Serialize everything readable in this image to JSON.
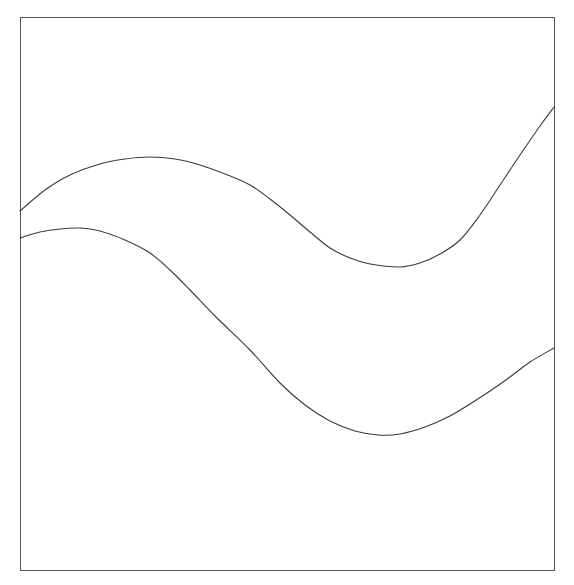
{
  "figure": {
    "background_color": "#ffffff",
    "width": 574,
    "height": 585
  },
  "plot_frame": {
    "name": "plot-border",
    "x": 20,
    "y": 17,
    "width": 534,
    "height": 553,
    "stroke_color": "#555555",
    "stroke_width": 1.2,
    "fill": "none"
  },
  "chart_data": {
    "type": "line",
    "title": "",
    "xlabel": "",
    "ylabel": "",
    "grid": false,
    "legend": "none",
    "axis_ticks": "none",
    "axis_tick_labels": "none",
    "xlim": [
      20,
      554
    ],
    "ylim": [
      570,
      17
    ],
    "note": "Two smooth S-shaped (sigmoidal/wave) curves drawn in pixel coordinates; y increases downward in screen space. Both curves enter at the left border and exit at the right border.",
    "series": [
      {
        "name": "upper-curve",
        "stroke_color": "#3a3a3a",
        "stroke_width": 1.1,
        "start_point": {
          "x": 20,
          "y": 211
        },
        "end_point": {
          "x": 554,
          "y": 107
        },
        "peak": {
          "x": 150,
          "y": 157
        },
        "trough": {
          "x": 400,
          "y": 267
        },
        "points": [
          {
            "x": 20,
            "y": 211
          },
          {
            "x": 45,
            "y": 190
          },
          {
            "x": 70,
            "y": 175
          },
          {
            "x": 100,
            "y": 164
          },
          {
            "x": 125,
            "y": 159
          },
          {
            "x": 150,
            "y": 157
          },
          {
            "x": 175,
            "y": 159
          },
          {
            "x": 200,
            "y": 165
          },
          {
            "x": 225,
            "y": 174
          },
          {
            "x": 250,
            "y": 185
          },
          {
            "x": 270,
            "y": 199
          },
          {
            "x": 290,
            "y": 215
          },
          {
            "x": 310,
            "y": 232
          },
          {
            "x": 330,
            "y": 248
          },
          {
            "x": 350,
            "y": 258
          },
          {
            "x": 370,
            "y": 264
          },
          {
            "x": 400,
            "y": 267
          },
          {
            "x": 420,
            "y": 263
          },
          {
            "x": 440,
            "y": 254
          },
          {
            "x": 460,
            "y": 240
          },
          {
            "x": 480,
            "y": 215
          },
          {
            "x": 500,
            "y": 185
          },
          {
            "x": 520,
            "y": 155
          },
          {
            "x": 540,
            "y": 126
          },
          {
            "x": 554,
            "y": 107
          }
        ]
      },
      {
        "name": "lower-curve",
        "stroke_color": "#3a3a3a",
        "stroke_width": 1.1,
        "start_point": {
          "x": 20,
          "y": 238
        },
        "end_point": {
          "x": 554,
          "y": 348
        },
        "peak": {
          "x": 80,
          "y": 228
        },
        "trough": {
          "x": 378,
          "y": 435
        },
        "points": [
          {
            "x": 20,
            "y": 238
          },
          {
            "x": 40,
            "y": 232
          },
          {
            "x": 60,
            "y": 229
          },
          {
            "x": 80,
            "y": 228
          },
          {
            "x": 100,
            "y": 231
          },
          {
            "x": 125,
            "y": 240
          },
          {
            "x": 150,
            "y": 253
          },
          {
            "x": 170,
            "y": 270
          },
          {
            "x": 190,
            "y": 290
          },
          {
            "x": 215,
            "y": 316
          },
          {
            "x": 250,
            "y": 350
          },
          {
            "x": 280,
            "y": 383
          },
          {
            "x": 305,
            "y": 405
          },
          {
            "x": 330,
            "y": 421
          },
          {
            "x": 355,
            "y": 431
          },
          {
            "x": 378,
            "y": 435
          },
          {
            "x": 400,
            "y": 434
          },
          {
            "x": 425,
            "y": 427
          },
          {
            "x": 450,
            "y": 416
          },
          {
            "x": 470,
            "y": 404
          },
          {
            "x": 490,
            "y": 391
          },
          {
            "x": 510,
            "y": 377
          },
          {
            "x": 530,
            "y": 362
          },
          {
            "x": 554,
            "y": 348
          }
        ]
      }
    ]
  }
}
